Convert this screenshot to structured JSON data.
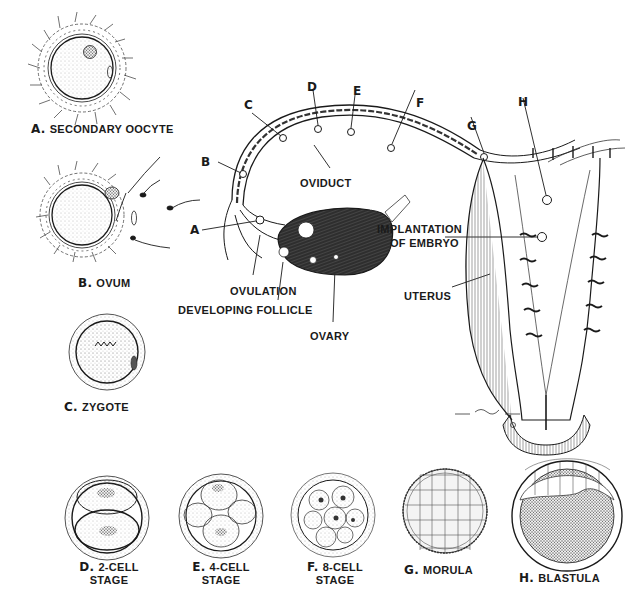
{
  "diagram": {
    "stages": [
      {
        "letter": "A.",
        "name": "SECONDARY OOCYTE"
      },
      {
        "letter": "B.",
        "name": "OVUM"
      },
      {
        "letter": "C.",
        "name": "ZYGOTE"
      },
      {
        "letter": "D.",
        "name": "2-CELL",
        "line2": "STAGE"
      },
      {
        "letter": "E.",
        "name": "4-CELL",
        "line2": "STAGE"
      },
      {
        "letter": "F.",
        "name": "8-CELL",
        "line2": "STAGE"
      },
      {
        "letter": "G.",
        "name": "MORULA"
      },
      {
        "letter": "H.",
        "name": "BLASTULA"
      }
    ],
    "path_markers": [
      "A",
      "B",
      "C",
      "D",
      "E",
      "F",
      "G",
      "H"
    ],
    "anatomy_labels": {
      "oviduct": "OVIDUCT",
      "ovulation": "OVULATION",
      "developing_follicle": "DEVELOPING FOLLICLE",
      "ovary": "OVARY",
      "implantation_line1": "IMPLANTATION",
      "implantation_line2": "OF EMBRYO",
      "uterus": "UTERUS"
    },
    "signature": "D. Giddings",
    "colors": {
      "ink": "#1a1a1a",
      "background": "#ffffff",
      "ovary_fill": "#3a3a3a"
    }
  }
}
